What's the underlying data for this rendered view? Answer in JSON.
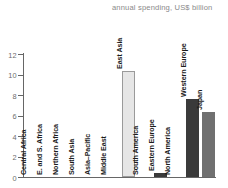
{
  "chart_data": {
    "type": "bar",
    "title": "annual spending, US$ billion",
    "xlabel": "",
    "ylabel": "",
    "ylim": [
      0,
      12
    ],
    "yticks": [
      0,
      2,
      4,
      6,
      8,
      10,
      12
    ],
    "grid": false,
    "legend": "none",
    "categories": [
      "Central Africa",
      "E. and S. Africa",
      "Northern Africa",
      "South Asia",
      "Asia–Pacific",
      "Middle East",
      "East Asia",
      "South America",
      "Eastern Europe",
      "North America",
      "Western Europe",
      "Japan"
    ],
    "values": [
      0,
      0,
      0,
      0,
      0,
      0,
      10.3,
      0,
      0.4,
      0,
      7.6,
      6.3
    ],
    "bar_colors": [
      "#e8e8e8",
      "#e8e8e8",
      "#e8e8e8",
      "#e8e8e8",
      "#e8e8e8",
      "#e8e8e8",
      "#e6e6e6",
      "#e8e8e8",
      "#3a3a3a",
      "#e8e8e8",
      "#3a3a3a",
      "#707070"
    ]
  },
  "axis": {
    "line_color": "#666666",
    "tick_label_color": "#6e6e6e"
  },
  "title_color": "#8a8a8a"
}
